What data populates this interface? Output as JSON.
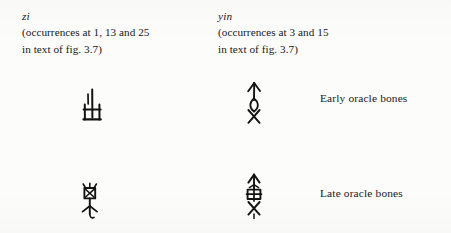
{
  "figure": {
    "columns": [
      {
        "id": "zi",
        "romanization": "zi",
        "gloss_line_1": "(occurrences at 1, 13 and 25",
        "gloss_line_2": "in text of fig. 3.7)"
      },
      {
        "id": "yin",
        "romanization": "yin",
        "gloss_line_1": "(occurrences at 3 and 15",
        "gloss_line_2": "in text of fig. 3.7)"
      }
    ],
    "rows": [
      {
        "id": "early",
        "label": "Early oracle bones"
      },
      {
        "id": "late",
        "label": "Late oracle bones"
      }
    ],
    "glyphs": [
      {
        "id": "zi-early",
        "column": "zi",
        "row": "early",
        "script": "oracle-bone-script",
        "name": "glyph-zi-early"
      },
      {
        "id": "yin-early",
        "column": "yin",
        "row": "early",
        "script": "oracle-bone-script",
        "name": "glyph-yin-early"
      },
      {
        "id": "zi-late",
        "column": "zi",
        "row": "late",
        "script": "oracle-bone-script",
        "name": "glyph-zi-late"
      },
      {
        "id": "yin-late",
        "column": "yin",
        "row": "late",
        "script": "oracle-bone-script",
        "name": "glyph-yin-late"
      }
    ],
    "colors": {
      "page_background": "#fcfcfa",
      "ink": "#131313",
      "text": "#1b1b1b"
    }
  }
}
